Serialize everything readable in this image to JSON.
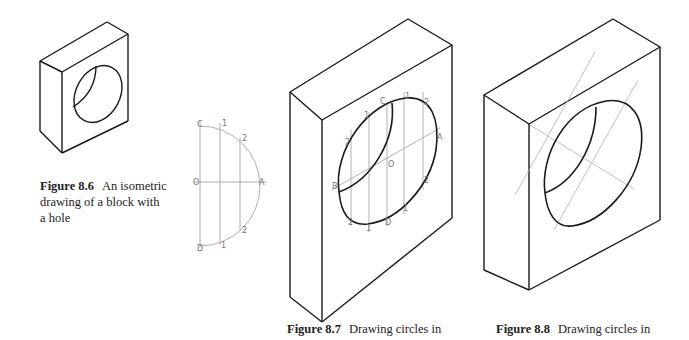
{
  "figures": [
    {
      "id": "8.6",
      "label": "Figure 8.6",
      "caption_lines": [
        "An isometric",
        "drawing of a block with",
        "a hole"
      ]
    },
    {
      "id": "8.7",
      "label": "Figure 8.7",
      "caption_lines": [
        "Drawing circles in"
      ],
      "construction_labels": {
        "semicircle": [
          "C",
          "1",
          "2",
          "O",
          "A",
          "2",
          "D",
          "1"
        ],
        "ellipse": [
          "C",
          "1",
          "2",
          "1",
          "2",
          "A",
          "O",
          "B",
          "2",
          "2",
          "1",
          "D",
          "1"
        ]
      }
    },
    {
      "id": "8.8",
      "label": "Figure 8.8",
      "caption_lines": [
        "Drawing circles in"
      ]
    }
  ],
  "colors": {
    "ink": "#1a1a1a",
    "construction": "#9a9a9a",
    "background": "#ffffff"
  }
}
